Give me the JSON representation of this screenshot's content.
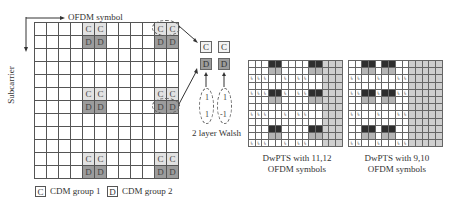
{
  "diagram": {
    "axis": {
      "horizontal_label": "OFDM symbol",
      "vertical_label": "Subcarrier"
    },
    "big_grid": {
      "rows": 12,
      "cols": 12,
      "cells": [
        {
          "row": 0,
          "col": 4,
          "type": "c",
          "label": "C"
        },
        {
          "row": 0,
          "col": 5,
          "type": "c",
          "label": "C"
        },
        {
          "row": 0,
          "col": 10,
          "type": "c",
          "label": "C"
        },
        {
          "row": 0,
          "col": 11,
          "type": "c",
          "label": "C"
        },
        {
          "row": 1,
          "col": 4,
          "type": "d",
          "label": "D"
        },
        {
          "row": 1,
          "col": 5,
          "type": "d",
          "label": "D"
        },
        {
          "row": 1,
          "col": 10,
          "type": "d",
          "label": "D"
        },
        {
          "row": 1,
          "col": 11,
          "type": "d",
          "label": "D"
        },
        {
          "row": 5,
          "col": 4,
          "type": "c",
          "label": "C"
        },
        {
          "row": 5,
          "col": 5,
          "type": "c",
          "label": "C"
        },
        {
          "row": 5,
          "col": 10,
          "type": "c",
          "label": "C"
        },
        {
          "row": 5,
          "col": 11,
          "type": "c",
          "label": "C"
        },
        {
          "row": 6,
          "col": 4,
          "type": "d",
          "label": "D"
        },
        {
          "row": 6,
          "col": 5,
          "type": "d",
          "label": "D"
        },
        {
          "row": 6,
          "col": 10,
          "type": "d",
          "label": "D"
        },
        {
          "row": 6,
          "col": 11,
          "type": "d",
          "label": "D"
        },
        {
          "row": 10,
          "col": 4,
          "type": "c",
          "label": "C"
        },
        {
          "row": 10,
          "col": 5,
          "type": "c",
          "label": "C"
        },
        {
          "row": 10,
          "col": 10,
          "type": "c",
          "label": "C"
        },
        {
          "row": 10,
          "col": 11,
          "type": "c",
          "label": "C"
        },
        {
          "row": 11,
          "col": 4,
          "type": "d",
          "label": "D"
        },
        {
          "row": 11,
          "col": 5,
          "type": "d",
          "label": "D"
        },
        {
          "row": 11,
          "col": 10,
          "type": "d",
          "label": "D"
        },
        {
          "row": 11,
          "col": 11,
          "type": "d",
          "label": "D"
        }
      ]
    },
    "legend": [
      {
        "symbol": "C",
        "label": "CDM group 1"
      },
      {
        "symbol": "D",
        "label": "CDM group 2"
      }
    ],
    "walsh": {
      "boxes_top": [
        "C",
        "C"
      ],
      "boxes_bottom": [
        "D",
        "D"
      ],
      "codes": [
        [
          "1",
          "1"
        ],
        [
          "1",
          "-1"
        ]
      ],
      "caption": "2 layer Walsh"
    },
    "small_grids": [
      {
        "caption_line1": "DwPTS with 11,12",
        "caption_line2": "OFDM symbols",
        "rows": 12,
        "cols": 14,
        "dark_cols": [
          3,
          4,
          9,
          10
        ],
        "shaded_cols": [
          11,
          12,
          13
        ],
        "dark_rows": [
          0,
          4,
          9
        ],
        "mark_rows": [
          2,
          4,
          7,
          11
        ],
        "mark_cols": [
          0,
          1,
          2,
          5,
          7,
          8
        ],
        "mark": "↳"
      },
      {
        "caption_line1": "DwPTS with 9,10",
        "caption_line2": "OFDM symbols",
        "rows": 12,
        "cols": 14,
        "dark_cols": [
          2,
          3,
          5,
          6
        ],
        "shaded_cols": [
          9,
          10,
          11,
          12,
          13
        ],
        "dark_rows": [
          0,
          4,
          9
        ],
        "mark_rows": [
          2,
          4,
          7,
          11
        ],
        "mark_cols": [
          0,
          1,
          2,
          4,
          7,
          8
        ],
        "mark": "↳"
      }
    ]
  }
}
